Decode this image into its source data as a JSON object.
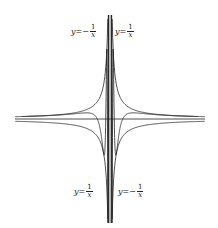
{
  "figure": {
    "colors": {
      "stroke": "#222222",
      "background": "#ffffff"
    },
    "labels": {
      "top_left": {
        "lhs": "y",
        "eq": "=",
        "sign": "−",
        "num": "1",
        "den": "x"
      },
      "top_right": {
        "lhs": "y",
        "eq": "=",
        "sign": "",
        "num": "1",
        "den": "x"
      },
      "bottom_left": {
        "lhs": "y",
        "eq": "=",
        "sign": "",
        "num": "1",
        "den": "x"
      },
      "bottom_right": {
        "lhs": "y",
        "eq": "=",
        "sign": "−",
        "num": "1",
        "den": "x"
      }
    }
  },
  "chart_data": {
    "type": "line",
    "title": "",
    "xlabel": "",
    "ylabel": "",
    "grid": false,
    "series": [
      {
        "name": "y = 1/x",
        "role": "upper envelope (x>0), lower (x<0)"
      },
      {
        "name": "y = -1/x",
        "role": "upper envelope (x<0), lower (x>0)"
      },
      {
        "name": "oscillating curve",
        "role": "bounded between hyperbolas, oscillates infinitely near x=0"
      }
    ],
    "axes": {
      "x_axis_visible": true,
      "y_axis_visible": false
    }
  }
}
